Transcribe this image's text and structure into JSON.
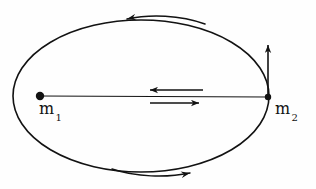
{
  "figure": {
    "background_color": "#fefefe",
    "ink_color": "#121212",
    "width": 316,
    "height": 189
  },
  "labels": {
    "m1": {
      "base": "m",
      "subscript": "1",
      "x": 39,
      "y": 99
    },
    "m2": {
      "base": "m",
      "subscript": "2",
      "x": 275,
      "y": 99
    }
  },
  "bodies": {
    "m1_marker": {
      "name": "filled-dot",
      "cx": 40,
      "cy": 96,
      "r": 4.2
    },
    "m2_marker": {
      "name": "filled-dot",
      "cx": 268,
      "cy": 97,
      "r": 3.2
    }
  },
  "ellipse": {
    "cx": 141,
    "cy": 96,
    "rx": 128,
    "ry": 76,
    "stroke_width": 1.6,
    "fill": "none"
  },
  "separation_line": {
    "x1": 40,
    "y1": 96,
    "x2": 268,
    "y2": 97,
    "stroke_width": 1.1
  },
  "arrows": {
    "left_force_arrow": {
      "direction": "left",
      "x_start": 203,
      "x_end": 148,
      "y": 90
    },
    "right_force_arrow": {
      "direction": "right",
      "x_start": 150,
      "x_end": 201,
      "y": 103
    },
    "velocity_arrow": {
      "direction": "up",
      "x": 268,
      "y_start": 97,
      "y_end": 42
    },
    "top_orbit_arrow": {
      "direction": "counterclockwise-left",
      "label": "orbit direction top"
    },
    "bottom_orbit_arrow": {
      "direction": "counterclockwise-right",
      "label": "orbit direction bottom"
    }
  }
}
